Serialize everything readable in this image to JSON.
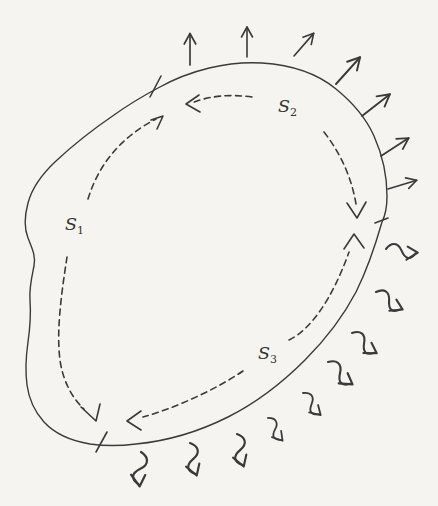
{
  "figure": {
    "type": "closed-surface-flux-diagram",
    "colors": {
      "paper": "#f5f4f0",
      "ink": "#3a3a3a"
    },
    "labels": {
      "s1": {
        "base": "S",
        "sub": "1"
      },
      "s2": {
        "base": "S",
        "sub": "2"
      },
      "s3": {
        "base": "S",
        "sub": "3"
      }
    },
    "elements": {
      "surface_segments": 3,
      "tick_marks": 3,
      "straight_outward_arrows": 7,
      "wavy_outward_arrows": 9,
      "dashed_segment_arrows": 6
    }
  }
}
